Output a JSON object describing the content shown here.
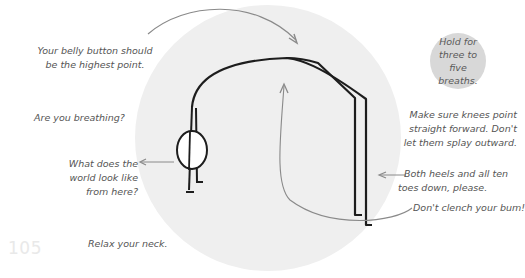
{
  "illustration": {
    "pose": "downward-facing dog",
    "circle_color": "#efefef",
    "line_color": "#1a1a1a",
    "arrow_color": "#8a8a8a"
  },
  "callout": {
    "text": "Hold for\nthree to five\nbreaths.",
    "bg_color": "#d8d8d8"
  },
  "annotations": {
    "belly_button": "Your belly button should\nbe the highest point.",
    "breathing": "Are you breathing?",
    "world_view": "What does the\nworld look like\nfrom here?",
    "relax_neck": "Relax your neck.",
    "knees": "Make sure knees point\nstraight forward. Don't\nlet them splay outward.",
    "heels": "Both heels and all ten\ntoes down, please.",
    "bum": "Don't clench your bum!"
  },
  "page": {
    "number": "105"
  },
  "text_color": "#555555"
}
